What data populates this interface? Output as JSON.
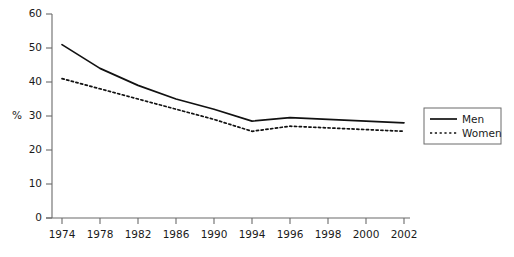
{
  "chart_data": {
    "type": "line",
    "title": "",
    "xlabel": "",
    "ylabel": "%",
    "categories": [
      "1974",
      "1978",
      "1982",
      "1986",
      "1990",
      "1994",
      "1996",
      "1998",
      "2000",
      "2002"
    ],
    "series": [
      {
        "name": "Men",
        "style": "solid",
        "color": "#111111",
        "values": [
          51,
          44,
          39,
          35,
          32,
          28.5,
          29.5,
          29,
          28.5,
          28
        ]
      },
      {
        "name": "Women",
        "style": "dotted",
        "color": "#111111",
        "values": [
          41,
          38,
          35,
          32,
          29,
          25.5,
          27,
          26.5,
          26,
          25.5
        ]
      }
    ],
    "ylim": [
      0,
      60
    ],
    "ytick_labels": [
      "0",
      "10",
      "20",
      "30",
      "40",
      "50",
      "60"
    ],
    "ytick_values": [
      0,
      10,
      20,
      30,
      40,
      50,
      60
    ],
    "grid": false,
    "legend_position": "right",
    "legend_entries": [
      {
        "label": "Men",
        "style": "solid"
      },
      {
        "label": "Women",
        "style": "dotted"
      }
    ]
  },
  "axes": {
    "y_axis_label": "%",
    "y_ticks": [
      "60",
      "50",
      "40",
      "30",
      "20",
      "10",
      "0"
    ],
    "x_ticks": [
      "1974",
      "1978",
      "1982",
      "1986",
      "1990",
      "1994",
      "1996",
      "1998",
      "2000",
      "2002"
    ]
  },
  "legend": {
    "men_label": "Men",
    "women_label": "Women"
  }
}
